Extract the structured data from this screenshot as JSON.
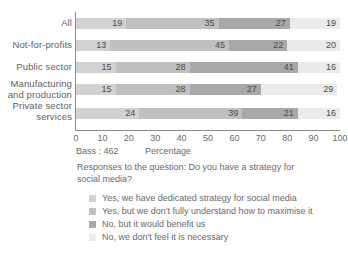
{
  "chart_data": {
    "type": "bar",
    "orientation": "horizontal",
    "stacked": true,
    "title": "",
    "subtitle": "",
    "xlabel": "Percentage",
    "ylabel": "",
    "xlim": [
      0,
      100
    ],
    "xticks": [
      0,
      10,
      20,
      30,
      40,
      50,
      60,
      70,
      80,
      90,
      100
    ],
    "grid": false,
    "legend_position": "bottom-left",
    "categories": [
      "All",
      "Not-for-profits",
      "Public sector",
      "Manufacturing and production",
      "Private sector services"
    ],
    "series": [
      {
        "name": "Yes, we have dedicated strategy for social media",
        "color": "#d2d2d2",
        "values": [
          19,
          13,
          15,
          15,
          24
        ]
      },
      {
        "name": "Yes, but we don't fully understand how to maximise it",
        "color": "#c0c0c0",
        "values": [
          35,
          45,
          28,
          28,
          39
        ]
      },
      {
        "name": "No, but it would benefit us",
        "color": "#a8a8a8",
        "values": [
          27,
          22,
          41,
          27,
          21
        ]
      },
      {
        "name": "No, we don't feel it is necessary",
        "color": "#ebebeb",
        "values": [
          19,
          20,
          16,
          29,
          16
        ]
      }
    ],
    "annotations": {
      "base": "Bass : 462",
      "caption": "Responses to the question: Do you have a strategy for social media?"
    }
  },
  "category_labels": [
    {
      "lines": [
        "All"
      ]
    },
    {
      "lines": [
        "Not-for-profits"
      ]
    },
    {
      "lines": [
        "Public sector"
      ]
    },
    {
      "lines": [
        "Manufacturing",
        "and production"
      ]
    },
    {
      "lines": [
        "Private sector",
        "services"
      ]
    }
  ],
  "axis": {
    "tick_labels": [
      "0",
      "10",
      "20",
      "30",
      "40",
      "50",
      "60",
      "70",
      "80",
      "90",
      "100"
    ],
    "x_axis_title": "Percentage",
    "base_note": "Bass : 462"
  },
  "caption": {
    "line1": "Responses to the question: Do you have a strategy for",
    "line2": "social media?"
  },
  "legend": {
    "items": [
      {
        "label": "Yes, we have dedicated strategy for social media",
        "color": "#d2d2d2"
      },
      {
        "label": "Yes, but we don't fully understand how to maximise it",
        "color": "#c0c0c0"
      },
      {
        "label": "No, but it would benefit us",
        "color": "#a8a8a8"
      },
      {
        "label": "No, we don't feel it is necessary",
        "color": "#ebebeb"
      }
    ]
  }
}
